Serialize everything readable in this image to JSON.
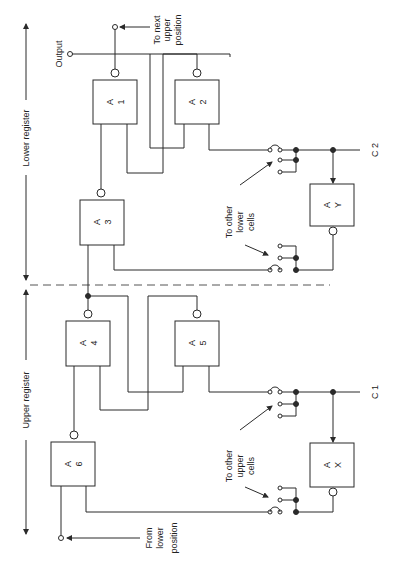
{
  "diagram": {
    "regions": {
      "lower_register": "Lower register",
      "upper_register": "Upper register"
    },
    "gates": [
      {
        "id": "A1",
        "line1": "A",
        "line2": "1"
      },
      {
        "id": "A2",
        "line1": "A",
        "line2": "2"
      },
      {
        "id": "A3",
        "line1": "A",
        "line2": "3"
      },
      {
        "id": "A4",
        "line1": "A",
        "line2": "4"
      },
      {
        "id": "A5",
        "line1": "A",
        "line2": "5"
      },
      {
        "id": "A6",
        "line1": "A",
        "line2": "6"
      },
      {
        "id": "AY",
        "line1": "A",
        "line2": "Y"
      },
      {
        "id": "AX",
        "line1": "A",
        "line2": "X"
      }
    ],
    "labels": {
      "output": "Output",
      "to_next_upper": [
        "To next",
        "upper",
        "position"
      ],
      "from_lower": [
        "From",
        "lower",
        "position"
      ],
      "to_other_lower": [
        "To other",
        "lower",
        "cells"
      ],
      "to_other_upper": [
        "To other",
        "upper",
        "cells"
      ],
      "c2": "C 2",
      "c1": "C 1"
    },
    "colors": {
      "line": "#2a2a2a",
      "background": "#ffffff",
      "divider": "#555555"
    }
  }
}
